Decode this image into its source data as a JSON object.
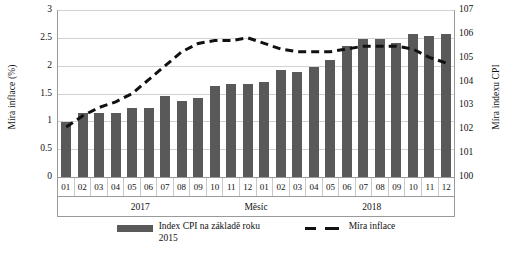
{
  "chart_data": {
    "type": "bar",
    "title": "",
    "xlabel": "Měsíc",
    "ylabel": "Míra inflace (%)",
    "ylabel_secondary": "Míra indexu CPI",
    "grid": true,
    "legend_position": "bottom",
    "categories": [
      "01",
      "02",
      "03",
      "04",
      "05",
      "06",
      "07",
      "08",
      "09",
      "10",
      "11",
      "12",
      "01",
      "02",
      "03",
      "04",
      "05",
      "06",
      "07",
      "08",
      "09",
      "10",
      "11",
      "12"
    ],
    "groups": [
      {
        "label": "2017",
        "span": 12
      },
      {
        "label": "2018",
        "span": 12
      }
    ],
    "ylim": [
      0,
      3
    ],
    "yticks": [
      "0",
      "0.5",
      "1",
      "1.5",
      "2",
      "2.5",
      "3"
    ],
    "ylim_secondary": [
      100,
      107
    ],
    "yticks_secondary": [
      "100",
      "101",
      "102",
      "103",
      "104",
      "105",
      "106",
      "107"
    ],
    "series": [
      {
        "name": "Index CPI na základě roku 2015",
        "type": "bar",
        "axis": "secondary",
        "color": "#595959",
        "values": [
          102.3,
          102.7,
          102.7,
          102.7,
          102.9,
          102.9,
          103.4,
          103.2,
          103.3,
          103.8,
          103.9,
          103.9,
          104.0,
          104.5,
          104.4,
          104.6,
          104.9,
          105.5,
          105.8,
          105.8,
          105.6,
          106.0,
          105.9,
          106.0
        ]
      },
      {
        "name": "Míra inflace",
        "type": "line",
        "axis": "primary",
        "style": "dashed",
        "color": "#111111",
        "values": [
          0.9,
          1.1,
          1.25,
          1.35,
          1.5,
          1.75,
          2.0,
          2.25,
          2.4,
          2.45,
          2.45,
          2.5,
          2.4,
          2.3,
          2.25,
          2.25,
          2.25,
          2.3,
          2.35,
          2.35,
          2.35,
          2.3,
          2.15,
          2.05
        ]
      }
    ]
  },
  "axes": {
    "left_title": "Míra inflace (%)",
    "right_title": "Míra indexu CPI",
    "bottom_title": "Měsíc"
  },
  "legend": {
    "items": [
      {
        "label": "Index CPI na základě roku 2015",
        "marker": "bar-swatch"
      },
      {
        "label": "Míra inflace",
        "marker": "dashed-line-swatch"
      }
    ]
  }
}
